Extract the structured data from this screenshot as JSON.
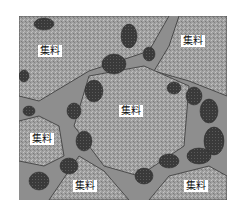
{
  "figure": {
    "colors": {
      "aggregate": "#a3a3a3",
      "matrix": "#8c8c8c",
      "dark_particles": "#3a3a3a",
      "boundary": "#4a4a4a",
      "label_bg": "#ffffff"
    },
    "labels": [
      {
        "text": "集料",
        "x": 50,
        "y": 51
      },
      {
        "text": "集料",
        "x": 193,
        "y": 41
      },
      {
        "text": "集料",
        "x": 131,
        "y": 111
      },
      {
        "text": "集料",
        "x": 42,
        "y": 139
      },
      {
        "text": "集料",
        "x": 85,
        "y": 186
      },
      {
        "text": "集料",
        "x": 196,
        "y": 186
      }
    ]
  }
}
